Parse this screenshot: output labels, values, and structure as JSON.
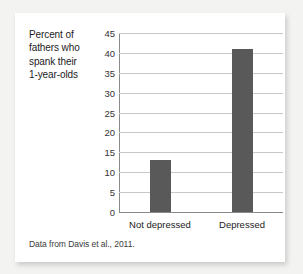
{
  "card": {
    "axis_caption_lines": [
      "Percent of",
      "fathers who",
      "spank their",
      "1-year-olds"
    ],
    "source_note": "Data from Davis et al., 2011."
  },
  "colors": {
    "bar": "#595959",
    "gridline": "#c8c8c8",
    "axis": "#8a8a8a",
    "card_background": "#ffffff",
    "page_background": "#f3f3f2"
  },
  "chart_data": {
    "type": "bar",
    "title": "",
    "categories": [
      "Not depressed",
      "Depressed"
    ],
    "values": [
      13,
      41
    ],
    "xlabel": "",
    "ylabel": "Percent of fathers who spank their 1-year-olds",
    "ylim": [
      0,
      45
    ],
    "ytick_step": 5,
    "yticks": [
      0,
      5,
      10,
      15,
      20,
      25,
      30,
      35,
      40,
      45
    ],
    "ytick_labels": [
      "0",
      "5",
      "10",
      "15",
      "20",
      "25",
      "30",
      "35",
      "40",
      "45"
    ],
    "grid": true,
    "grid_axis": "y",
    "legend": false,
    "legend_position": "none",
    "bar_color": "#595959",
    "annotation": "Data from Davis et al., 2011."
  }
}
